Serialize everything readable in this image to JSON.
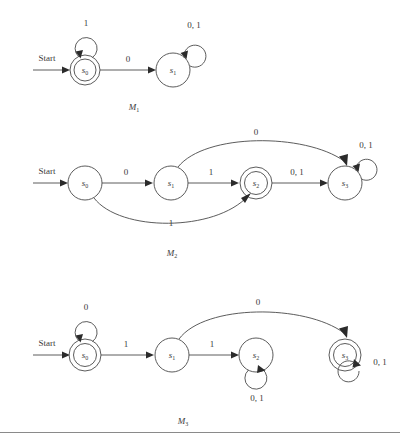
{
  "figure": {
    "title": "",
    "background": "#ffffff",
    "line_color": "#4a4a4a",
    "text_color": "#3a3a3a"
  },
  "start_label": "Start",
  "machines": [
    {
      "id": "M1",
      "caption_base": "M",
      "caption_sub": "1",
      "states": [
        {
          "id": "s0",
          "base": "s",
          "sub": "0",
          "accepting": true,
          "start": true
        },
        {
          "id": "s1",
          "base": "s",
          "sub": "1",
          "accepting": false,
          "start": false
        }
      ],
      "transitions": [
        {
          "from": "s0",
          "to": "s0",
          "label": "1",
          "kind": "self-loop-top"
        },
        {
          "from": "s0",
          "to": "s1",
          "label": "0",
          "kind": "straight"
        },
        {
          "from": "s1",
          "to": "s1",
          "label": "0, 1",
          "kind": "self-loop-top-right"
        }
      ]
    },
    {
      "id": "M2",
      "caption_base": "M",
      "caption_sub": "2",
      "states": [
        {
          "id": "s0",
          "base": "s",
          "sub": "0",
          "accepting": false,
          "start": true
        },
        {
          "id": "s1",
          "base": "s",
          "sub": "1",
          "accepting": false,
          "start": false
        },
        {
          "id": "s2",
          "base": "s",
          "sub": "2",
          "accepting": true,
          "start": false
        },
        {
          "id": "s3",
          "base": "s",
          "sub": "3",
          "accepting": false,
          "start": false
        }
      ],
      "transitions": [
        {
          "from": "s0",
          "to": "s1",
          "label": "0",
          "kind": "straight"
        },
        {
          "from": "s1",
          "to": "s2",
          "label": "1",
          "kind": "straight"
        },
        {
          "from": "s2",
          "to": "s3",
          "label": "0, 1",
          "kind": "straight"
        },
        {
          "from": "s1",
          "to": "s3",
          "label": "0",
          "kind": "curve-above"
        },
        {
          "from": "s0",
          "to": "s2",
          "label": "1",
          "kind": "curve-below"
        },
        {
          "from": "s3",
          "to": "s3",
          "label": "0, 1",
          "kind": "self-loop-top-right"
        }
      ]
    },
    {
      "id": "M3",
      "caption_base": "M",
      "caption_sub": "3",
      "states": [
        {
          "id": "s0",
          "base": "s",
          "sub": "0",
          "accepting": true,
          "start": true
        },
        {
          "id": "s1",
          "base": "s",
          "sub": "1",
          "accepting": false,
          "start": false
        },
        {
          "id": "s2",
          "base": "s",
          "sub": "2",
          "accepting": false,
          "start": false
        },
        {
          "id": "s3",
          "base": "s",
          "sub": "3",
          "accepting": true,
          "start": false
        }
      ],
      "transitions": [
        {
          "from": "s0",
          "to": "s0",
          "label": "0",
          "kind": "self-loop-top"
        },
        {
          "from": "s0",
          "to": "s1",
          "label": "1",
          "kind": "straight"
        },
        {
          "from": "s1",
          "to": "s2",
          "label": "1",
          "kind": "straight"
        },
        {
          "from": "s1",
          "to": "s3",
          "label": "0",
          "kind": "curve-above"
        },
        {
          "from": "s2",
          "to": "s2",
          "label": "0, 1",
          "kind": "self-loop-bottom"
        },
        {
          "from": "s3",
          "to": "s3",
          "label": "0, 1",
          "kind": "self-loop-bottom-right"
        }
      ]
    }
  ],
  "labels": {
    "m1_start": "Start",
    "m1_loop_s0": "1",
    "m1_s0_s1": "0",
    "m1_loop_s1": "0, 1",
    "m1_caption_base": "M",
    "m1_caption_sub": "1",
    "m1_s0_base": "s",
    "m1_s0_sub": "0",
    "m1_s1_base": "s",
    "m1_s1_sub": "1",
    "m2_start": "Start",
    "m2_s0_s1": "0",
    "m2_s1_s2": "1",
    "m2_s2_s3": "0, 1",
    "m2_s1_s3": "0",
    "m2_s0_s2": "1",
    "m2_loop_s3": "0, 1",
    "m2_caption_base": "M",
    "m2_caption_sub": "2",
    "m2_s0_base": "s",
    "m2_s0_sub": "0",
    "m2_s1_base": "s",
    "m2_s1_sub": "1",
    "m2_s2_base": "s",
    "m2_s2_sub": "2",
    "m2_s3_base": "s",
    "m2_s3_sub": "3",
    "m3_start": "Start",
    "m3_loop_s0": "0",
    "m3_s0_s1": "1",
    "m3_s1_s2": "1",
    "m3_s1_s3": "0",
    "m3_loop_s2": "0, 1",
    "m3_loop_s3": "0, 1",
    "m3_caption_base": "M",
    "m3_caption_sub": "3",
    "m3_s0_base": "s",
    "m3_s0_sub": "0",
    "m3_s1_base": "s",
    "m3_s1_sub": "1",
    "m3_s2_base": "s",
    "m3_s2_sub": "2",
    "m3_s3_base": "s",
    "m3_s3_sub": "3"
  }
}
